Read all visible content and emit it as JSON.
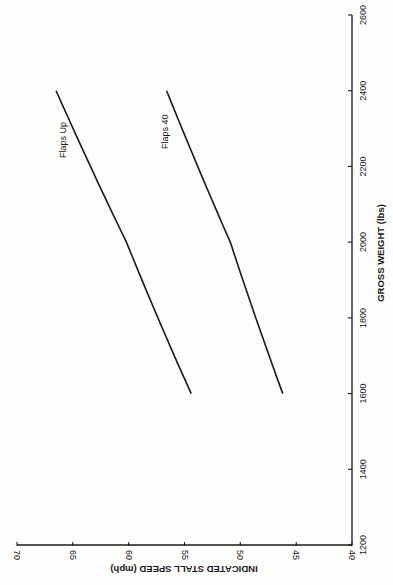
{
  "chart_data": {
    "type": "line",
    "orientation_note": "figure rendered rotated 90° clockwise on page",
    "title": "",
    "xlabel": "GROSS WEIGHT (lbs)",
    "ylabel": "INDICATED STALL SPEED (mph)",
    "xlim": [
      1200,
      2600
    ],
    "ylim": [
      40,
      70
    ],
    "x_ticks": [
      1200,
      1400,
      1600,
      1800,
      2000,
      2200,
      2400,
      2600
    ],
    "y_ticks": [
      40,
      45,
      50,
      55,
      60,
      65,
      70
    ],
    "grid": false,
    "legend": "inline labels",
    "series": [
      {
        "name": "Flaps Up",
        "x": [
          1600,
          2000,
          2400
        ],
        "values": [
          54.4,
          60.2,
          66.5
        ]
      },
      {
        "name": "Flaps 40",
        "x": [
          1600,
          2000,
          2400
        ],
        "values": [
          46.2,
          50.9,
          56.6
        ]
      }
    ]
  },
  "labels": {
    "x_axis_title": "GROSS WEIGHT (lbs)",
    "y_axis_title": "INDICATED STALL SPEED (mph)",
    "series_flaps_up": "Flaps Up",
    "series_flaps_40": "Flaps 40",
    "x_tick_1200": "1200",
    "x_tick_1400": "1400",
    "x_tick_1600": "1600",
    "x_tick_1800": "1800",
    "x_tick_2000": "2000",
    "x_tick_2200": "2200",
    "x_tick_2400": "2400",
    "x_tick_2600": "2600",
    "y_tick_40": "40",
    "y_tick_45": "45",
    "y_tick_50": "50",
    "y_tick_55": "55",
    "y_tick_60": "60",
    "y_tick_65": "65",
    "y_tick_70": "70"
  },
  "colors": {
    "line": "#1a1a1a",
    "background": "#fdfdfc"
  }
}
